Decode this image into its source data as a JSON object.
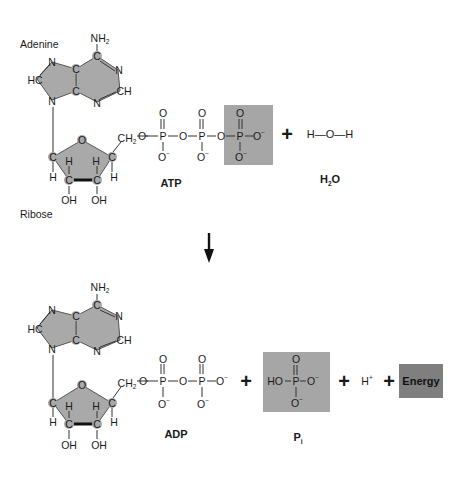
{
  "colors": {
    "ring_fill": "#a9a9a9",
    "phosphate_box": "#a6a6a6",
    "energy_box": "#7f7f7f",
    "text": "#1a1a1a"
  },
  "reactants": {
    "adenine_label": "Adenine",
    "ribose_label": "Ribose",
    "atp_label": "ATP",
    "water_label_main": "H",
    "water_label_sub": "2",
    "water_label_end": "O",
    "water_structure": "H—O—H",
    "plus": "+"
  },
  "adenine": {
    "nh2": "NH",
    "nh2_sub": "2",
    "atoms": [
      "C",
      "N",
      "CH",
      "N",
      "C",
      "C",
      "N",
      "HC",
      "N"
    ]
  },
  "ribose": {
    "o": "O",
    "c": "C",
    "h": "H",
    "oh": "OH",
    "ch2": "CH",
    "ch2_sub": "2"
  },
  "phosphate": {
    "o": "O",
    "p": "P",
    "o_minus": "O",
    "minus": "−",
    "bridge_o": "O"
  },
  "arrow": {
    "direction": "down"
  },
  "products": {
    "adp_label": "ADP",
    "pi_label_main": "P",
    "pi_label_sub": "i",
    "pi_structure_ho": "HO",
    "h_plus": "H",
    "h_plus_sup": "+",
    "energy_label": "Energy",
    "plus": "+"
  }
}
